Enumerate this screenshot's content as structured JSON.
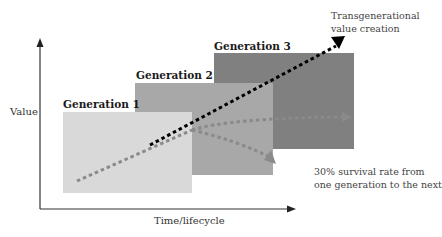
{
  "diagram": {
    "type": "value-over-generations",
    "axes": {
      "y_label": "Value",
      "x_label": "Time/lifecycle"
    },
    "generations": [
      {
        "label": "Generation 1",
        "color": "#d9d9d9"
      },
      {
        "label": "Generation 2",
        "color": "#a8a8a8"
      },
      {
        "label": "Generation 3",
        "color": "#808080"
      }
    ],
    "annotations": {
      "top_right_line1": "Transgenerational",
      "top_right_line2": "value creation",
      "bottom_right_line1": "30% survival rate from",
      "bottom_right_line2": "one generation to the next"
    },
    "colors": {
      "trend_line": "#000000",
      "survival_lines": "#8a8a8a",
      "axis": "#333333"
    }
  }
}
